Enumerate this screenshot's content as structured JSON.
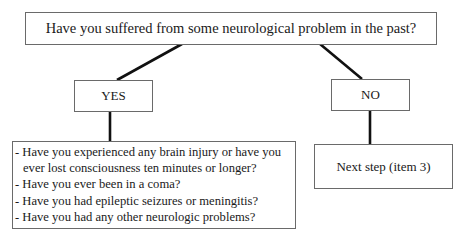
{
  "question": "Have you suffered from some neurological problem in the past?",
  "branches": {
    "yes": {
      "label": "YES",
      "followup": [
        "- Have you experienced any brain injury or have you",
        "ever lost consciousness ten minutes or longer?",
        "- Have you ever been in a coma?",
        "- Have you had epileptic seizures or meningitis?",
        "- Have you had any other neurologic problems?"
      ]
    },
    "no": {
      "label": "NO",
      "next": "Next step (item 3)"
    }
  },
  "colors": {
    "connector": "#111111",
    "border": "#6a6a6a",
    "text": "#1a1a1a"
  }
}
